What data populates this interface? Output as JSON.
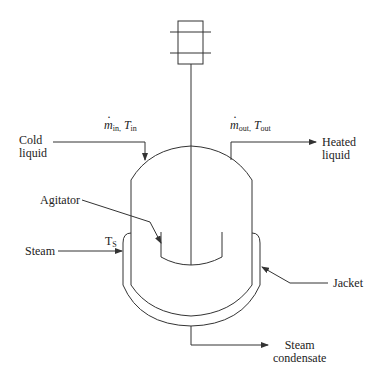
{
  "diagram": {
    "labels": {
      "cold_liquid_line1": "Cold",
      "cold_liquid_line2": "liquid",
      "heated_liquid_line1": "Heated",
      "heated_liquid_line2": "liquid",
      "agitator": "Agitator",
      "steam": "Steam",
      "jacket": "Jacket",
      "condensate_line1": "Steam",
      "condensate_line2": "condensate",
      "steam_temp_main": "T",
      "steam_temp_sub": "S"
    },
    "symbols": {
      "inlet_flow_var": "m",
      "inlet_flow_sub": "in,",
      "inlet_temp_var": "T",
      "inlet_temp_sub": "in",
      "outlet_flow_var": "m",
      "outlet_flow_sub": "out,",
      "outlet_temp_var": "T",
      "outlet_temp_sub": "out"
    },
    "caption": "",
    "colors": {
      "line": "#333333",
      "text": "#222222",
      "background": "#ffffff"
    }
  }
}
